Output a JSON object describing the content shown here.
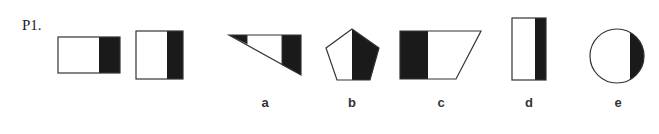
{
  "problem": {
    "label": "P1."
  },
  "colors": {
    "stroke": "#333333",
    "fill_dark": "#1a1a1a",
    "fill_light": "#ffffff"
  },
  "stimulus_figures": [
    {
      "name": "wide-rectangle-right-shaded",
      "shape": "rectangle"
    },
    {
      "name": "tall-rectangle-right-shaded",
      "shape": "rectangle"
    }
  ],
  "options": [
    {
      "label": "a",
      "shape": "right-triangle-two-shaded-ends"
    },
    {
      "label": "b",
      "shape": "pentagon-right-half-shaded"
    },
    {
      "label": "c",
      "shape": "trapezoid-left-shaded"
    },
    {
      "label": "d",
      "shape": "tall-rectangle-right-shaded"
    },
    {
      "label": "e",
      "shape": "circle-right-segment-shaded"
    }
  ]
}
